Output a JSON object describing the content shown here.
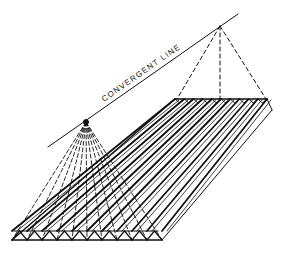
{
  "figure": {
    "labels": {
      "convergent_line": "CONVERGENT  LINE"
    },
    "colors": {
      "ink": "#111111",
      "background": "#ffffff"
    },
    "geometry": {
      "convergent_line": {
        "x1": 48,
        "y1": 147,
        "x2": 238,
        "y2": 14
      },
      "far_vanishing_point": {
        "x": 220,
        "y": 26
      },
      "near_vanishing_point": {
        "x": 86,
        "y": 122
      },
      "slab_back_edge": {
        "x1": 175,
        "y1": 99,
        "x2": 267,
        "y2": 99
      },
      "slab_front_edge": {
        "x1": 12,
        "y1": 240,
        "x2": 162,
        "y2": 240
      },
      "ridge_count": 10
    }
  }
}
